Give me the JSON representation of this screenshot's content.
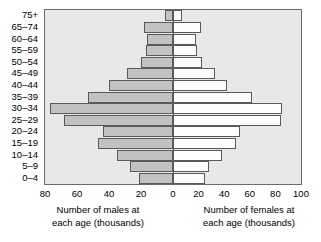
{
  "chart_data": {
    "type": "bar",
    "subtype": "population-pyramid",
    "title": "",
    "categories": [
      "0–4",
      "5–9",
      "10–14",
      "15–19",
      "20–24",
      "25–29",
      "30–34",
      "35–39",
      "40–44",
      "45–49",
      "50–54",
      "55–59",
      "60–64",
      "65–74",
      "75+"
    ],
    "series": [
      {
        "name": "Number of males at each age (thousands)",
        "side": "left",
        "color": "#c2c2c2",
        "values": [
          21,
          27,
          35,
          47,
          44,
          68,
          77,
          53,
          40,
          29,
          20,
          17,
          16,
          18,
          5
        ]
      },
      {
        "name": "Number of females at each age (thousands)",
        "side": "right",
        "color": "#fdfdfd",
        "values": [
          25,
          28,
          38,
          49,
          52,
          84,
          85,
          62,
          42,
          33,
          23,
          19,
          18,
          22,
          7
        ]
      }
    ],
    "xlabel_left": "Number of males at each age (thousands)",
    "xlabel_right": "Number of females at each age (thousands)",
    "ylabel": "",
    "xticks_left": [
      80,
      60,
      40,
      20
    ],
    "xticks_right": [
      0,
      20,
      40,
      60,
      80,
      100
    ],
    "xlim_left": [
      0,
      80
    ],
    "xlim_right": [
      0,
      100
    ],
    "grid": false,
    "legend": "none",
    "plot_background": "#e8e8e8"
  },
  "axis": {
    "tick_labels": [
      "80",
      "60",
      "40",
      "20",
      "0",
      "20",
      "40",
      "60",
      "80",
      "100"
    ],
    "captions": {
      "male_line1": "Number of males at",
      "male_line2": "each age (thousands)",
      "female_line1": "Number of females at",
      "female_line2": "each age (thousands)"
    }
  }
}
